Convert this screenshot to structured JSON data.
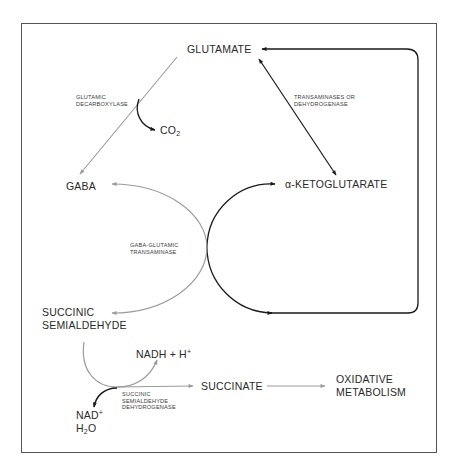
{
  "diagram": {
    "colors": {
      "primary_path": "#1a1a1a",
      "gaba_path": "#9a9a9a",
      "frame": "#555555"
    },
    "nodes": {
      "glutamate": "GLUTAMATE",
      "gaba": "GABA",
      "alpha_ketoglutarate": "α-KETOGLUTARATE",
      "succinic_semialdehyde_line1": "SUCCINIC",
      "succinic_semialdehyde_line2": "SEMIALDEHYDE",
      "succinate": "SUCCINATE",
      "oxidative_metabolism_line1": "OXIDATIVE",
      "oxidative_metabolism_line2": "METABOLISM",
      "co2_base": "CO",
      "co2_sub": "2",
      "nadh_base": "NADH + H",
      "nadh_sup": "+",
      "nad_base": "NAD",
      "nad_sup": "+",
      "h2o_h": "H",
      "h2o_sub": "2",
      "h2o_o": "O"
    },
    "enzymes": {
      "glutamic_decarboxylase_line1": "GLUTAMIC",
      "glutamic_decarboxylase_line2": "DECARBOXYLASE",
      "transaminases_line1": "TRANSAMINASES OR",
      "transaminases_line2": "DEHYDROGENASE",
      "gaba_transaminase_line1": "GABA-GLUTAMIC",
      "gaba_transaminase_line2": "TRANSAMINASE",
      "ssa_dehydrogenase_line1": "SUCCINIC",
      "ssa_dehydrogenase_line2": "SEMIALDEHYDE",
      "ssa_dehydrogenase_line3": "DEHYDROGENASE"
    },
    "edges": [
      {
        "from": "GLUTAMATE",
        "to": "GABA",
        "enzyme": "GLUTAMIC DECARBOXYLASE",
        "byproduct": "CO2"
      },
      {
        "from": "GLUTAMATE",
        "to": "α-KETOGLUTARATE",
        "enzyme": "TRANSAMINASES OR DEHYDROGENASE",
        "bidirectional": true
      },
      {
        "from": "GABA",
        "to": "SUCCINIC SEMIALDEHYDE",
        "enzyme": "GABA-GLUTAMIC TRANSAMINASE",
        "coupled": "α-KETOGLUTARATE → GLUTAMATE"
      },
      {
        "from": "SUCCINIC SEMIALDEHYDE",
        "to": "SUCCINATE",
        "enzyme": "SUCCINIC SEMIALDEHYDE DEHYDROGENASE",
        "cofactors_in": "NAD+ H2O",
        "cofactors_out": "NADH + H+"
      },
      {
        "from": "SUCCINATE",
        "to": "OXIDATIVE METABOLISM"
      }
    ]
  }
}
